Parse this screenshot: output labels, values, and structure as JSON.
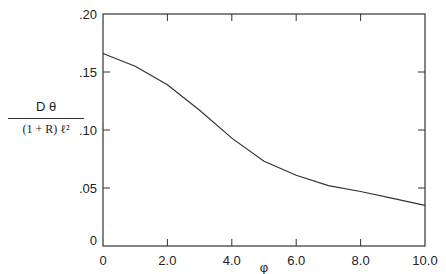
{
  "chart_data": {
    "type": "line",
    "title": "",
    "xlabel": "φ",
    "ylabel_numerator": "D θ",
    "ylabel_denominator": "(1 + R) ℓ²",
    "xlim": [
      0,
      10
    ],
    "ylim": [
      0,
      0.2
    ],
    "x_ticks": [
      "0",
      "2.0",
      "4.0",
      "6.0",
      "8.0",
      "10.0"
    ],
    "y_ticks": [
      "0",
      ".05",
      ".10",
      ".15",
      ".20"
    ],
    "grid": false,
    "series": [
      {
        "name": "curve",
        "x": [
          0,
          1,
          2,
          3,
          4,
          5,
          6,
          7,
          8,
          9,
          10
        ],
        "values": [
          0.166,
          0.155,
          0.139,
          0.117,
          0.093,
          0.073,
          0.061,
          0.052,
          0.047,
          0.041,
          0.035
        ]
      }
    ]
  }
}
